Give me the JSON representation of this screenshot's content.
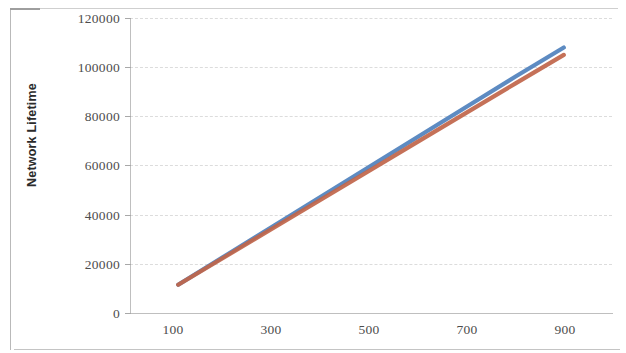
{
  "chart_data": {
    "type": "line",
    "title": "",
    "xlabel": "",
    "ylabel": "Network Lifetime",
    "xlim": [
      0,
      1000
    ],
    "ylim": [
      0,
      120000
    ],
    "grid": true,
    "legend_position": "none",
    "x_ticks": [
      "100",
      "300",
      "500",
      "700",
      "900"
    ],
    "x_tick_values": [
      100,
      300,
      500,
      700,
      900
    ],
    "y_ticks": [
      "0",
      "20000",
      "40000",
      "60000",
      "80000",
      "100000",
      "120000"
    ],
    "y_tick_values": [
      0,
      20000,
      40000,
      60000,
      80000,
      100000,
      120000
    ],
    "x": [
      100,
      200,
      300,
      400,
      500,
      600,
      700,
      800,
      900
    ],
    "series": [
      {
        "name": "series-1",
        "color": "#4F81BD",
        "values": [
          11500,
          23600,
          35700,
          47800,
          59900,
          72000,
          84100,
          96200,
          108000
        ]
      },
      {
        "name": "series-2",
        "color": "#C0654A",
        "values": [
          11500,
          23200,
          34900,
          46600,
          58300,
          70000,
          81700,
          93400,
          105000
        ]
      }
    ]
  },
  "axes": {
    "y_title": "Network Lifetime",
    "y_tick_labels": [
      "120000",
      "100000",
      "80000",
      "60000",
      "40000",
      "20000",
      "0"
    ],
    "x_tick_labels": [
      "100",
      "300",
      "500",
      "700",
      "900"
    ]
  },
  "colors": {
    "series_1": "#4F81BD",
    "series_2": "#C0654A",
    "gridline": "#dcdcdc",
    "axis": "#bfbfbf",
    "text": "#4d4d4d",
    "background": "#ffffff"
  }
}
